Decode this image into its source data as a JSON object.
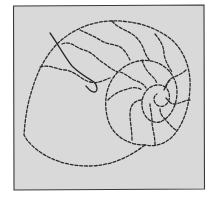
{
  "image": {
    "subject": "nautilus shell line drawing",
    "colors": {
      "background": "#ffffff",
      "panel": "#d9d9d9",
      "frame": "#3a3a3a",
      "ink": "#2a2a2a"
    }
  }
}
